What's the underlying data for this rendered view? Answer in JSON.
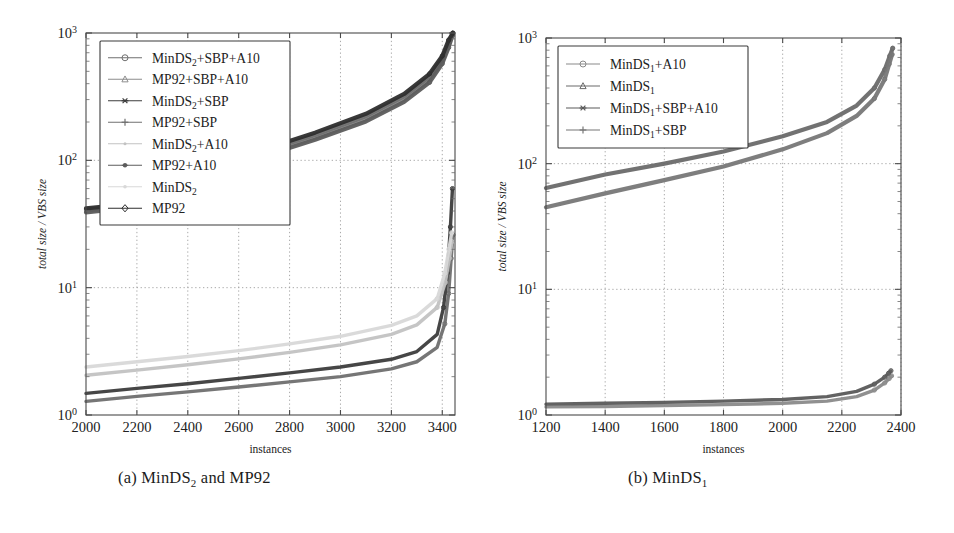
{
  "figure": {
    "background": "#ffffff",
    "panels": [
      {
        "id": "a",
        "caption_prefix": "(a)",
        "caption_main": "MinDS",
        "caption_sub": "2",
        "caption_suffix": " and MP92",
        "caption_plain": "(a) MinDS2 and MP92",
        "chart_data": {
          "type": "line",
          "title": "",
          "xlabel": "instances",
          "ylabel": "total size / VBS size",
          "xlim": [
            2000,
            3450
          ],
          "ylim": [
            1,
            1000
          ],
          "yscale": "log",
          "xticks": [
            2000,
            2200,
            2400,
            2600,
            2800,
            3000,
            3200,
            3400
          ],
          "xticklabels": [
            "2000",
            "2200",
            "2400",
            "2600",
            "2800",
            "3000",
            "3200",
            "3400"
          ],
          "yticks": [
            1,
            10,
            100,
            1000
          ],
          "yticklabels": [
            "10^0",
            "10^1",
            "10^2",
            "10^3"
          ],
          "grid": true,
          "legend_position": "upper-left",
          "series": [
            {
              "name": "MinDS2+SBP+A10",
              "label_main": "MinDS",
              "label_sub": "2",
              "label_suffix": "+SBP+A10",
              "marker": "circle",
              "color": "#6f6f6f",
              "group": "lower",
              "x": [
                2000,
                2200,
                2400,
                2600,
                2800,
                3000,
                3200,
                3300,
                3380,
                3410,
                3425,
                3435,
                3442
              ],
              "y": [
                1.28,
                1.4,
                1.52,
                1.66,
                1.82,
                2.0,
                2.3,
                2.62,
                3.4,
                5.2,
                9.0,
                17.0,
                26.0
              ]
            },
            {
              "name": "MP92+SBP+A10",
              "label_main": "MP92+SBP+A10",
              "label_sub": "",
              "label_suffix": "",
              "marker": "triangle",
              "color": "#8d8d8d",
              "group": "upper",
              "x": [
                2000,
                2200,
                2400,
                2600,
                2700,
                2900,
                3100,
                3250,
                3350,
                3400,
                3425,
                3440
              ],
              "y": [
                40,
                44,
                49,
                56,
                112,
                150,
                210,
                300,
                430,
                600,
                800,
                980
              ]
            },
            {
              "name": "MinDS2+SBP",
              "label_main": "MinDS",
              "label_sub": "2",
              "label_suffix": "+SBP",
              "marker": "asterisk",
              "color": "#3c3c3c",
              "group": "lower",
              "x": [
                2000,
                2200,
                2400,
                2600,
                2800,
                3000,
                3200,
                3300,
                3380,
                3405,
                3420,
                3432,
                3440
              ],
              "y": [
                1.48,
                1.62,
                1.76,
                1.94,
                2.14,
                2.38,
                2.74,
                3.15,
                4.3,
                7.0,
                13.0,
                30.0,
                60.0
              ]
            },
            {
              "name": "MP92+SBP",
              "label_main": "MP92+SBP",
              "label_sub": "",
              "label_suffix": "",
              "marker": "plus",
              "color": "#707070",
              "group": "upper",
              "x": [
                2000,
                2200,
                2400,
                2600,
                2700,
                2900,
                3100,
                3250,
                3350,
                3400,
                3425,
                3440
              ],
              "y": [
                41,
                45,
                51,
                58,
                118,
                158,
                222,
                318,
                455,
                630,
                840,
                995
              ]
            },
            {
              "name": "MinDS2+A10",
              "label_main": "MinDS",
              "label_sub": "2",
              "label_suffix": "+A10",
              "marker": "dot",
              "color": "#c2c2c2",
              "group": "lower",
              "x": [
                2000,
                2200,
                2400,
                2600,
                2800,
                3000,
                3200,
                3300,
                3380,
                3412,
                3428,
                3438
              ],
              "y": [
                2.05,
                2.25,
                2.48,
                2.76,
                3.1,
                3.55,
                4.3,
                5.1,
                7.0,
                11.0,
                17.0,
                23.0
              ]
            },
            {
              "name": "MP92+A10",
              "label_main": "MP92+A10",
              "label_sub": "",
              "label_suffix": "",
              "marker": "star",
              "color": "#5c5c5c",
              "group": "upper",
              "x": [
                2000,
                2200,
                2400,
                2600,
                2700,
                2900,
                3100,
                3250,
                3350,
                3400,
                3425,
                3440
              ],
              "y": [
                39,
                43,
                48,
                55,
                108,
                145,
                202,
                288,
                410,
                575,
                770,
                960
              ]
            },
            {
              "name": "MinDS2",
              "label_main": "MinDS",
              "label_sub": "2",
              "label_suffix": "",
              "marker": "faint-dot",
              "color": "#d8d8d8",
              "group": "lower",
              "x": [
                2000,
                2200,
                2400,
                2600,
                2800,
                3000,
                3200,
                3300,
                3380,
                3410,
                3426,
                3437
              ],
              "y": [
                2.38,
                2.62,
                2.88,
                3.2,
                3.62,
                4.15,
                5.05,
                6.0,
                8.2,
                13.0,
                20.0,
                27.0
              ]
            },
            {
              "name": "MP92",
              "label_main": "MP92",
              "label_sub": "",
              "label_suffix": "",
              "marker": "diamond",
              "color": "#2e2e2e",
              "group": "upper",
              "x": [
                2000,
                2200,
                2400,
                2600,
                2700,
                2900,
                3100,
                3250,
                3350,
                3400,
                3425,
                3442
              ],
              "y": [
                42,
                46,
                52,
                60,
                122,
                165,
                232,
                332,
                478,
                660,
                880,
                1000
              ]
            }
          ]
        }
      },
      {
        "id": "b",
        "caption_prefix": "(b)",
        "caption_main": "MinDS",
        "caption_sub": "1",
        "caption_suffix": "",
        "caption_plain": "(b) MinDS1",
        "chart_data": {
          "type": "line",
          "title": "",
          "xlabel": "instances",
          "ylabel": "total size / VBS size",
          "xlim": [
            1200,
            2400
          ],
          "ylim": [
            1,
            1000
          ],
          "yscale": "log",
          "xticks": [
            1200,
            1400,
            1600,
            1800,
            2000,
            2200,
            2400
          ],
          "xticklabels": [
            "1200",
            "1400",
            "1600",
            "1800",
            "2000",
            "2200",
            "2400"
          ],
          "yticks": [
            1,
            10,
            100,
            1000
          ],
          "yticklabels": [
            "10^0",
            "10^1",
            "10^2",
            "10^3"
          ],
          "grid": true,
          "legend_position": "upper-left",
          "series": [
            {
              "name": "MinDS1+A10",
              "label_main": "MinDS",
              "label_sub": "1",
              "label_suffix": "+A10",
              "marker": "circle",
              "color": "#8a8a8a",
              "group": "lower",
              "x": [
                1200,
                1400,
                1600,
                1800,
                2000,
                2150,
                2250,
                2310,
                2345,
                2360,
                2368
              ],
              "y": [
                1.16,
                1.17,
                1.19,
                1.21,
                1.24,
                1.29,
                1.4,
                1.58,
                1.8,
                1.95,
                2.05
              ]
            },
            {
              "name": "MinDS1",
              "label_main": "MinDS",
              "label_sub": "1",
              "label_suffix": "",
              "marker": "triangle",
              "color": "#6a6a6a",
              "group": "upper",
              "x": [
                1200,
                1400,
                1600,
                1800,
                2000,
                2150,
                2250,
                2310,
                2345,
                2362,
                2372
              ],
              "y": [
                64,
                82,
                100,
                125,
                165,
                215,
                290,
                400,
                560,
                720,
                830
              ]
            },
            {
              "name": "MinDS1+SBP+A10",
              "label_main": "MinDS",
              "label_sub": "1",
              "label_suffix": "+SBP+A10",
              "marker": "asterisk",
              "color": "#5a5a5a",
              "group": "lower",
              "x": [
                1200,
                1400,
                1600,
                1800,
                2000,
                2150,
                2250,
                2310,
                2345,
                2358,
                2366
              ],
              "y": [
                1.22,
                1.24,
                1.26,
                1.29,
                1.33,
                1.4,
                1.54,
                1.76,
                2.0,
                2.15,
                2.25
              ]
            },
            {
              "name": "MinDS1+SBP",
              "label_main": "MinDS",
              "label_sub": "1",
              "label_suffix": "+SBP",
              "marker": "plus",
              "color": "#777777",
              "group": "upper",
              "x": [
                1200,
                1400,
                1600,
                1800,
                2000,
                2150,
                2250,
                2310,
                2345,
                2360,
                2370
              ],
              "y": [
                45,
                58,
                74,
                95,
                130,
                175,
                240,
                330,
                470,
                620,
                740
              ]
            }
          ]
        }
      }
    ]
  }
}
